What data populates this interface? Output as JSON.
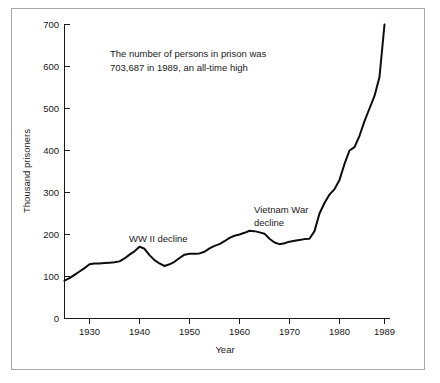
{
  "figure": {
    "border_color": "#a8a8a8",
    "background": "#ffffff",
    "line_color": "#0d0d0d",
    "text_color": "#1a1a1a"
  },
  "annotations": {
    "callout_line1": "The number of persons in prison was",
    "callout_line2": "703,687 in 1989, an all-time high",
    "wwii_label": "WW II decline",
    "vietnam_label_line1": "Vietnam War",
    "vietnam_label_line2": "decline"
  },
  "chart_data": {
    "type": "line",
    "title": "",
    "xlabel": "Year",
    "ylabel": "Thousand prisoners",
    "xlim": [
      1925,
      1990
    ],
    "ylim": [
      0,
      700
    ],
    "grid": false,
    "legend": null,
    "xticks": [
      1930,
      1940,
      1950,
      1960,
      1970,
      1980,
      1989
    ],
    "xtick_labels": [
      "1930",
      "1940",
      "1950",
      "1960",
      "1970",
      "1980",
      "1989"
    ],
    "yticks": [
      0,
      100,
      200,
      300,
      400,
      500,
      600,
      700
    ],
    "ytick_labels": [
      "0",
      "100",
      "200",
      "300",
      "400",
      "500",
      "600",
      "700"
    ],
    "series": [
      {
        "name": "Prisoners",
        "x": [
          1925,
          1926,
          1927,
          1928,
          1929,
          1930,
          1931,
          1932,
          1933,
          1934,
          1935,
          1936,
          1937,
          1938,
          1939,
          1940,
          1941,
          1942,
          1943,
          1944,
          1945,
          1946,
          1947,
          1948,
          1949,
          1950,
          1951,
          1952,
          1953,
          1954,
          1955,
          1956,
          1957,
          1958,
          1959,
          1960,
          1961,
          1962,
          1963,
          1964,
          1965,
          1966,
          1967,
          1968,
          1969,
          1970,
          1971,
          1972,
          1973,
          1974,
          1975,
          1976,
          1977,
          1978,
          1979,
          1980,
          1981,
          1982,
          1983,
          1984,
          1985,
          1986,
          1987,
          1988,
          1989
        ],
        "y": [
          90,
          96,
          104,
          112,
          120,
          129,
          131,
          131,
          132,
          133,
          134,
          136,
          143,
          152,
          160,
          171,
          166,
          151,
          139,
          131,
          125,
          129,
          135,
          144,
          152,
          154,
          154,
          155,
          159,
          167,
          173,
          177,
          184,
          192,
          197,
          200,
          204,
          209,
          208,
          205,
          202,
          190,
          181,
          177,
          179,
          183,
          185,
          187,
          189,
          190,
          208,
          250,
          275,
          295,
          308,
          330,
          368,
          400,
          408,
          435,
          470,
          500,
          530,
          575,
          700
        ]
      }
    ]
  }
}
